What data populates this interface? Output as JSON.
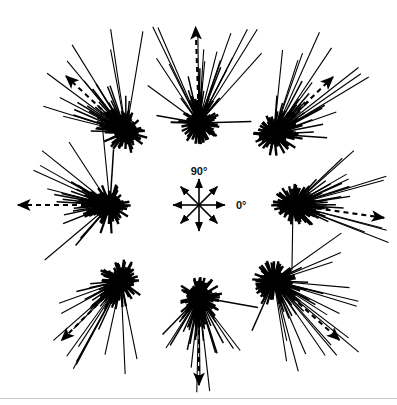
{
  "figure": {
    "type": "circular-vector-plot",
    "background_color": "#ffffff",
    "ink_color": "#000000",
    "rule_color": "#c9ccd1",
    "rule_y": 398,
    "width": 397,
    "height": 405
  },
  "compass": {
    "name": "central-compass-rose",
    "center_x": 199,
    "center_y": 205,
    "arm_length": 26,
    "arrow_count": 8,
    "directions_deg": [
      0,
      45,
      90,
      135,
      180,
      225,
      270,
      315
    ],
    "label_top": "90°",
    "label_right": "0°",
    "label_top_x": 199,
    "label_top_y": 175,
    "label_right_x": 236,
    "label_right_y": 209
  },
  "chart_data": {
    "type": "scatter",
    "title": "",
    "xlabel": "",
    "ylabel": "",
    "legend": [
      {
        "key": "individual-vector",
        "style": "solid-line",
        "label": "individual bearing"
      },
      {
        "key": "mean-vector",
        "style": "dashed-arrow",
        "label": "mean vector"
      }
    ],
    "axis_reference": {
      "zero_deg": "right",
      "ninety_deg": "up",
      "grid": false
    },
    "clusters": [
      {
        "name": "cluster-90",
        "training_direction_deg": 90,
        "center_x": 199,
        "center_y": 123,
        "mean_vector_deg": 92,
        "mean_vector_length": 96,
        "spread_deg": 68,
        "n_vectors": 46,
        "hub_radius": 19,
        "max_spoke": 108
      },
      {
        "name": "cluster-45",
        "training_direction_deg": 45,
        "center_x": 274,
        "center_y": 134,
        "mean_vector_deg": 44,
        "mean_vector_length": 82,
        "spread_deg": 70,
        "n_vectors": 46,
        "hub_radius": 19,
        "max_spoke": 112
      },
      {
        "name": "cluster-0",
        "training_direction_deg": 0,
        "center_x": 293,
        "center_y": 205,
        "mean_vector_deg": -8,
        "mean_vector_length": 92,
        "spread_deg": 72,
        "n_vectors": 46,
        "hub_radius": 19,
        "max_spoke": 100
      },
      {
        "name": "cluster-315",
        "training_direction_deg": 315,
        "center_x": 274,
        "center_y": 281,
        "mean_vector_deg": -42,
        "mean_vector_length": 88,
        "spread_deg": 70,
        "n_vectors": 46,
        "hub_radius": 19,
        "max_spoke": 108
      },
      {
        "name": "cluster-270",
        "training_direction_deg": 270,
        "center_x": 199,
        "center_y": 297,
        "mean_vector_deg": -90,
        "mean_vector_length": 88,
        "spread_deg": 70,
        "n_vectors": 46,
        "hub_radius": 19,
        "max_spoke": 92
      },
      {
        "name": "cluster-225",
        "training_direction_deg": 225,
        "center_x": 121,
        "center_y": 281,
        "mean_vector_deg": -135,
        "mean_vector_length": 84,
        "spread_deg": 70,
        "n_vectors": 46,
        "hub_radius": 19,
        "max_spoke": 104
      },
      {
        "name": "cluster-180",
        "training_direction_deg": 180,
        "center_x": 110,
        "center_y": 205,
        "mean_vector_deg": 180,
        "mean_vector_length": 92,
        "spread_deg": 74,
        "n_vectors": 46,
        "hub_radius": 19,
        "max_spoke": 96
      },
      {
        "name": "cluster-135",
        "training_direction_deg": 135,
        "center_x": 126,
        "center_y": 132,
        "mean_vector_deg": 137,
        "mean_vector_length": 82,
        "spread_deg": 70,
        "n_vectors": 46,
        "hub_radius": 19,
        "max_spoke": 100
      }
    ]
  }
}
